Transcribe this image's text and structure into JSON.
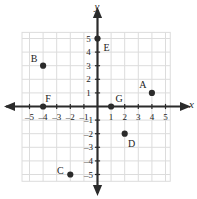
{
  "chart_data": {
    "type": "scatter",
    "title": "",
    "xlabel": "x",
    "ylabel": "y",
    "xlim": [
      -5.6,
      5.6
    ],
    "ylim": [
      -5.6,
      5.6
    ],
    "grid": true,
    "legend": "none",
    "x_ticks": [
      -5,
      -4,
      -3,
      -2,
      -1,
      1,
      2,
      3,
      4,
      5
    ],
    "y_ticks": [
      5,
      4,
      3,
      2,
      1,
      -1,
      -2,
      -3,
      -4,
      -5
    ],
    "x_tick_labels": [
      "–5",
      "–4",
      "–3",
      "–2",
      "–1",
      "1",
      "2",
      "3",
      "4",
      "5"
    ],
    "y_tick_labels": [
      "5",
      "4",
      "3",
      "2",
      "1",
      "–1",
      "–2",
      "–3",
      "–4",
      "–5"
    ],
    "points": [
      {
        "label": "A",
        "x": 4,
        "y": 1,
        "label_dx": -9,
        "label_dy": -9
      },
      {
        "label": "B",
        "x": -4,
        "y": 3,
        "label_dx": -9,
        "label_dy": -8
      },
      {
        "label": "C",
        "x": -2,
        "y": -5,
        "label_dx": -10,
        "label_dy": -5
      },
      {
        "label": "D",
        "x": 2,
        "y": -2,
        "label_dx": 7,
        "label_dy": 9
      },
      {
        "label": "E",
        "x": 0,
        "y": 5,
        "label_dx": 9,
        "label_dy": 8
      },
      {
        "label": "F",
        "x": -4,
        "y": 0,
        "label_dx": 5,
        "label_dy": -9
      },
      {
        "label": "G",
        "x": 1,
        "y": 0,
        "label_dx": 8,
        "label_dy": -9
      }
    ]
  },
  "colors": {
    "grid": "#dcdcdc",
    "axis": "#2b2b2b",
    "point": "#2b2b2b",
    "text": "#1d1d1d",
    "background": "#ffffff"
  }
}
